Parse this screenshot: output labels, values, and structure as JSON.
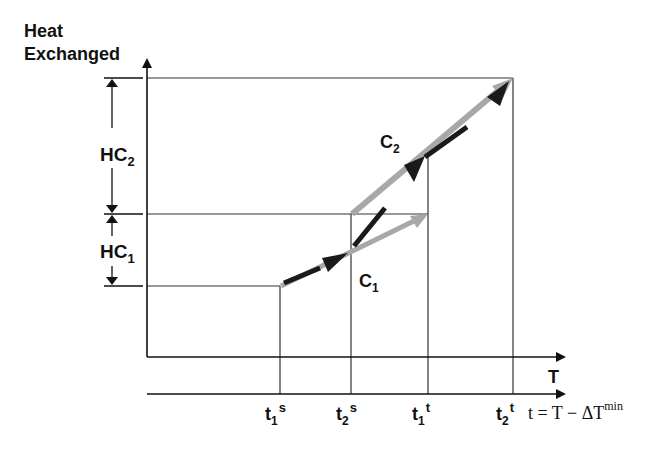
{
  "title": {
    "line1": "Heat",
    "line2": "Exchanged"
  },
  "axes": {
    "y_label_line1": "Heat",
    "y_label_line2": "Exchanged",
    "x_label": "T",
    "shifted_axis_formula": {
      "lhs": "t = T − ΔT",
      "superscript": "min"
    }
  },
  "dimensions": [
    {
      "label": "HC",
      "subscript": "2"
    },
    {
      "label": "HC",
      "subscript": "1"
    }
  ],
  "curves": [
    {
      "label": "C",
      "subscript": "1"
    },
    {
      "label": "C",
      "subscript": "2"
    }
  ],
  "ticks": [
    {
      "base": "t",
      "subscript": "1",
      "superscript": "s"
    },
    {
      "base": "t",
      "subscript": "2",
      "superscript": "s"
    },
    {
      "base": "t",
      "subscript": "1",
      "superscript": "t"
    },
    {
      "base": "t",
      "subscript": "2",
      "superscript": "t"
    }
  ],
  "colors": {
    "line": "#222222",
    "curve_grey": "#a8a8a8",
    "counter_black": "#1a1a1a"
  }
}
